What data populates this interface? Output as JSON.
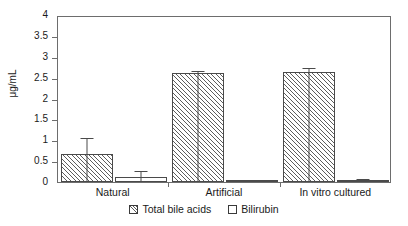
{
  "chart_data": {
    "type": "bar",
    "title": "",
    "xlabel": "",
    "ylabel": "μg/mL",
    "ylim": [
      0,
      4
    ],
    "ytick_values": [
      0,
      0.5,
      1,
      1.5,
      2,
      2.5,
      3,
      3.5,
      4
    ],
    "ytick_labels": [
      "0",
      "0.5",
      "1",
      "1.5",
      "2",
      "2.5",
      "3",
      "3.5",
      "4"
    ],
    "grid": false,
    "legend_position": "bottom-center",
    "categories": [
      "Natural",
      "Artificial",
      "In vitro cultured"
    ],
    "series": [
      {
        "name": "Total bile acids",
        "fill": "hatched",
        "values": [
          0.67,
          2.6,
          2.63
        ],
        "errors": [
          0.38,
          0.07,
          0.1
        ]
      },
      {
        "name": "Bilirubin",
        "fill": "white",
        "values": [
          0.11,
          0.02,
          0.06
        ],
        "errors": [
          0.16,
          0.0,
          0.02
        ]
      }
    ]
  },
  "axes": {
    "ylabel": "μg/mL"
  },
  "legend": {
    "items": [
      {
        "label": "Total bile acids"
      },
      {
        "label": "Bilirubin"
      }
    ]
  },
  "colors": {
    "axis": "#6d6d6d",
    "bar_outline": "#4a4a4a",
    "hatch": "#5d5d5d",
    "background": "#ffffff"
  }
}
